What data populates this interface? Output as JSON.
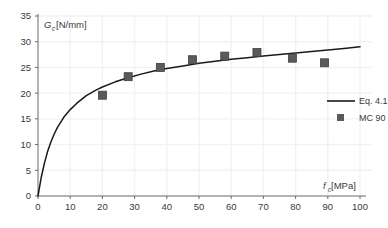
{
  "chart_data": {
    "type": "scatter",
    "title": "",
    "subtitle": "",
    "xlabel": "f_c [MPa]",
    "xlabel_main": "f",
    "xlabel_sub": "c",
    "xlabel_unit": " [MPa]",
    "ylabel": "G_c [N/mm]",
    "ylabel_main": "G",
    "ylabel_sub": "c",
    "ylabel_unit": " [N/mm]",
    "xlim": [
      0,
      100
    ],
    "ylim": [
      0,
      35
    ],
    "xticks": [
      0,
      10,
      20,
      30,
      40,
      50,
      60,
      70,
      80,
      90,
      100
    ],
    "yticks": [
      0,
      5,
      10,
      15,
      20,
      25,
      30,
      35
    ],
    "grid": true,
    "legend_position": "center-right",
    "series": [
      {
        "name": "Eq. 4.1",
        "type": "line",
        "color": "#1a1a1a",
        "x": [
          0,
          1,
          2,
          3,
          4,
          5,
          6,
          8,
          10,
          12,
          15,
          18,
          20,
          24,
          28,
          32,
          36,
          40,
          45,
          50,
          55,
          60,
          65,
          70,
          75,
          80,
          85,
          90,
          95,
          100
        ],
        "y": [
          0,
          3.6,
          6.4,
          8.7,
          10.5,
          12.0,
          13.3,
          15.3,
          16.8,
          18.0,
          19.5,
          20.6,
          21.2,
          22.2,
          23.0,
          23.7,
          24.3,
          24.8,
          25.3,
          25.8,
          26.2,
          26.6,
          26.9,
          27.2,
          27.5,
          27.8,
          28.1,
          28.4,
          28.7,
          29.0
        ]
      },
      {
        "name": "MC 90",
        "type": "scatter",
        "marker": "square",
        "color": "#5a5a5a",
        "points": [
          {
            "x": 20,
            "y": 19.6
          },
          {
            "x": 28,
            "y": 23.2
          },
          {
            "x": 38,
            "y": 25.0
          },
          {
            "x": 48,
            "y": 26.5
          },
          {
            "x": 58,
            "y": 27.2
          },
          {
            "x": 68,
            "y": 27.9
          },
          {
            "x": 79,
            "y": 26.8
          },
          {
            "x": 89,
            "y": 25.9
          }
        ]
      }
    ],
    "legend": [
      {
        "label": "Eq. 4.1",
        "marker": "line",
        "color": "#1a1a1a"
      },
      {
        "label": "MC 90",
        "marker": "square",
        "color": "#5a5a5a"
      }
    ]
  },
  "colors": {
    "background": "#ffffff",
    "grid": "#f2f2f2",
    "axis": "#6b6b6b",
    "line": "#1a1a1a",
    "marker": "#5a5a5a",
    "text": "#3a3a3a"
  }
}
